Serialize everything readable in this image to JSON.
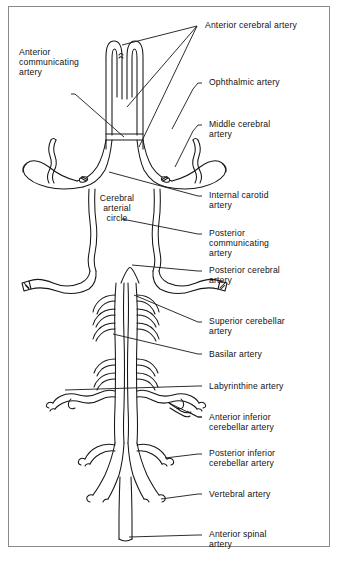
{
  "figure": {
    "frame_border_color": "#8a8a8a",
    "vessel_stroke_color": "#161616",
    "background_color": "#ffffff",
    "caption": ""
  },
  "inline_labels": [
    {
      "name": "cerebral-arterial-circle",
      "text": "Cerebral\narterial\ncircle"
    }
  ],
  "labels": [
    {
      "id": "anterior-cerebral-artery",
      "text": "Anterior cerebral artery"
    },
    {
      "id": "anterior-communicating-artery",
      "text": "Anterior\ncommunicating\nartery"
    },
    {
      "id": "ophthalmic-artery",
      "text": "Ophthalmic artery"
    },
    {
      "id": "middle-cerebral-artery",
      "text": "Middle cerebral\nartery"
    },
    {
      "id": "internal-carotid-artery",
      "text": "Internal carotid\nartery"
    },
    {
      "id": "posterior-communicating-artery",
      "text": "Posterior\ncommunicating\nartery"
    },
    {
      "id": "posterior-cerebral-artery",
      "text": "Posterior cerebral\nartery"
    },
    {
      "id": "superior-cerebellar-artery",
      "text": "Superior cerebellar\nartery"
    },
    {
      "id": "basilar-artery",
      "text": "Basilar artery"
    },
    {
      "id": "labyrinthine-artery",
      "text": "Labyrinthine artery"
    },
    {
      "id": "anterior-inferior-cerebellar-artery",
      "text": "Anterior inferior\ncerebellar artery"
    },
    {
      "id": "posterior-inferior-cerebellar-artery",
      "text": "Posterior inferior\ncerebellar artery"
    },
    {
      "id": "vertebral-artery",
      "text": "Vertebral artery"
    },
    {
      "id": "anterior-spinal-artery",
      "text": "Anterior spinal\nartery"
    }
  ]
}
